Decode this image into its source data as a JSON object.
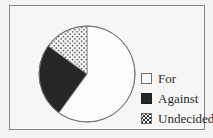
{
  "chart_data": {
    "type": "pie",
    "title": "",
    "slices": [
      {
        "label": "For",
        "value": 60,
        "fill": "white"
      },
      {
        "label": "Against",
        "value": 25,
        "fill": "solid-black"
      },
      {
        "label": "Undecided",
        "value": 15,
        "fill": "dotted"
      }
    ],
    "start_angle_deg": 90,
    "direction": "clockwise",
    "legend_position": "right",
    "legend_items": [
      "For",
      "Against",
      "Undecided"
    ]
  },
  "colors": {
    "ink": "#2b2b2b",
    "pie_black": "#262626",
    "pie_white": "#fcfcfb",
    "outline": "#8c8c8c",
    "circle_outline": "#6f6f6f",
    "frame_border": "#878787",
    "paper": "#f4f3f1",
    "panel": "#f7f6f4"
  }
}
